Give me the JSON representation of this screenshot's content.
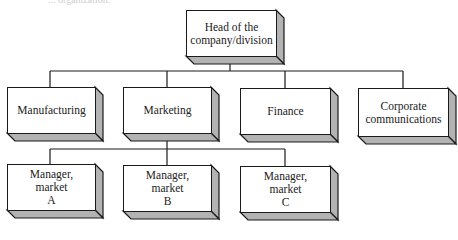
{
  "caption": "... organization.",
  "colors": {
    "face": "#ffffff",
    "depth": "#b3b3b3",
    "stroke": "#1a1a1a",
    "connector": "#1a1a1a"
  },
  "root": {
    "lines": [
      "Head of the",
      "company/division"
    ]
  },
  "departments": [
    {
      "id": "manufacturing",
      "lines": [
        "Manufacturing"
      ]
    },
    {
      "id": "marketing",
      "lines": [
        "Marketing"
      ]
    },
    {
      "id": "finance",
      "lines": [
        "Finance"
      ]
    },
    {
      "id": "corporate-communications",
      "lines": [
        "Corporate",
        "communications"
      ]
    }
  ],
  "managers": [
    {
      "id": "manager-market-a",
      "lines": [
        "Manager,",
        "market",
        "A"
      ]
    },
    {
      "id": "manager-market-b",
      "lines": [
        "Manager,",
        "market",
        "B"
      ]
    },
    {
      "id": "manager-market-c",
      "lines": [
        "Manager,",
        "market",
        "C"
      ]
    }
  ]
}
